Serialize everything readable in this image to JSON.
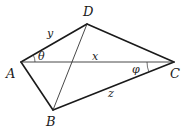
{
  "diagram": {
    "type": "quadrilateral-with-diagonals",
    "vertices": {
      "A": {
        "label": "A",
        "x": 21,
        "y": 62
      },
      "B": {
        "label": "B",
        "x": 53,
        "y": 110
      },
      "C": {
        "label": "C",
        "x": 174,
        "y": 62
      },
      "D": {
        "label": "D",
        "x": 87,
        "y": 24
      }
    },
    "edges": [
      "AD",
      "DC",
      "CB",
      "BA"
    ],
    "diagonals": [
      "AC",
      "BD"
    ],
    "side_labels": {
      "AD": "y",
      "AC": "x",
      "BC": "z"
    },
    "angle_labels": {
      "DAC": "θ",
      "ACB": "φ"
    }
  }
}
